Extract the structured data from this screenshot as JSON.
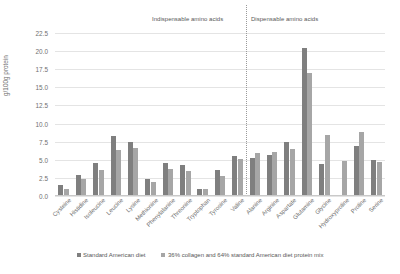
{
  "chart_data": {
    "type": "bar",
    "title": "",
    "xlabel": "",
    "ylabel": "g/100g protein",
    "ylim": [
      0,
      22.5
    ],
    "yticks": [
      "0.0",
      "2.5",
      "5.0",
      "7.5",
      "10.0",
      "12.5",
      "15.0",
      "17.5",
      "20.0",
      "22.5"
    ],
    "grid": true,
    "legend_position": "bottom",
    "categories": [
      "Cysteine",
      "Histidine",
      "Isoleucine",
      "Leucine",
      "Lysine",
      "Methionine",
      "Phenylalanine",
      "Threonine",
      "Tryptophan",
      "Tyrosine",
      "Valine",
      "Alanine",
      "Arginine",
      "Aspartate",
      "Glutamine",
      "Glycine",
      "Hydroxyproline",
      "Proline",
      "Serine"
    ],
    "series": [
      {
        "name": "Standard American diet",
        "color": "#7f7f7f",
        "values": [
          1.5,
          2.9,
          4.6,
          8.3,
          7.4,
          2.4,
          4.6,
          4.3,
          1.0,
          3.6,
          5.5,
          5.2,
          5.6,
          7.4,
          20.5,
          4.4,
          0.0,
          6.9,
          5.0
        ]
      },
      {
        "name": "36% collagen and 64% standard American diet protein mix",
        "color": "#a6a6a6",
        "values": [
          1.0,
          2.3,
          3.6,
          6.4,
          6.6,
          2.0,
          3.7,
          3.5,
          0.9,
          2.7,
          5.1,
          6.0,
          6.1,
          6.5,
          17.0,
          8.4,
          4.9,
          8.8,
          4.7
        ]
      }
    ],
    "annotations": [
      {
        "text": "Indispensable amino acids",
        "span": [
          "Cysteine",
          "Valine"
        ]
      },
      {
        "text": "Dispensable amino acids",
        "span": [
          "Alanine",
          "Serine"
        ]
      }
    ],
    "divider": {
      "after_category": "Valine",
      "style": "dotted"
    }
  },
  "legend": {
    "items": [
      {
        "label": "Standard American diet",
        "marker": "square-swatch"
      },
      {
        "label": "36% collagen and 64% standard American diet protein mix",
        "marker": "square-swatch"
      }
    ]
  },
  "group_headers": {
    "indispensable": "Indispensable amino acids",
    "dispensable": "Dispensable amino acids"
  }
}
